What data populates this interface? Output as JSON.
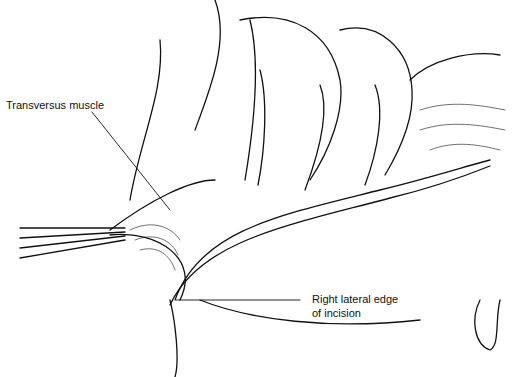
{
  "labels": {
    "transversus": "Transversus muscle",
    "edge_line1": "Right lateral edge",
    "edge_line2": "of incision"
  }
}
